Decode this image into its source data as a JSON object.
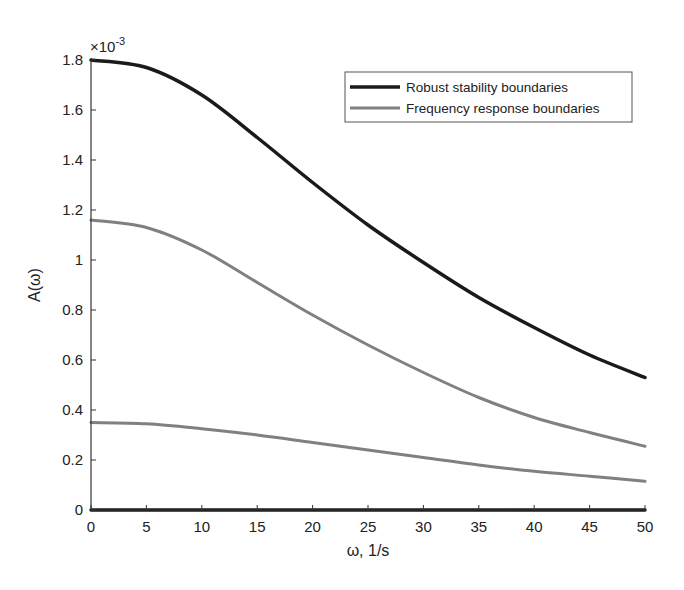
{
  "chart_data": {
    "type": "line",
    "title": "",
    "xlabel": "ω, 1/s",
    "ylabel": "A(ω)",
    "y_exponent_label": "×10",
    "y_exponent_power": "-3",
    "xlim": [
      0,
      50
    ],
    "ylim": [
      0,
      1.8
    ],
    "x_ticks": [
      0,
      5,
      10,
      15,
      20,
      25,
      30,
      35,
      40,
      45,
      50
    ],
    "y_ticks": [
      0,
      0.2,
      0.4,
      0.6,
      0.8,
      1,
      1.2,
      1.4,
      1.6,
      1.8
    ],
    "y_tick_labels": [
      "0",
      "0.2",
      "0.4",
      "0.6",
      "0.8",
      "1",
      "1.2",
      "1.4",
      "1.6",
      "1.8"
    ],
    "grid": false,
    "legend_position": "upper right",
    "x": [
      0,
      5,
      10,
      15,
      20,
      25,
      30,
      35,
      40,
      45,
      50
    ],
    "series": [
      {
        "name": "Robust stability boundaries",
        "color": "#1a1a1a",
        "width": 3.5,
        "legend": true,
        "values": [
          1.8,
          1.77,
          1.66,
          1.49,
          1.31,
          1.14,
          0.99,
          0.85,
          0.73,
          0.62,
          0.53
        ]
      },
      {
        "name": "Robust stability boundaries (lower)",
        "color": "#1a1a1a",
        "width": 3.5,
        "legend": false,
        "values": [
          0,
          0,
          0,
          0,
          0,
          0,
          0,
          0,
          0,
          0,
          0
        ]
      },
      {
        "name": "Frequency response boundaries",
        "color": "#808080",
        "width": 3,
        "legend": true,
        "values": [
          1.16,
          1.13,
          1.04,
          0.91,
          0.78,
          0.66,
          0.55,
          0.45,
          0.37,
          0.31,
          0.255
        ]
      },
      {
        "name": "Frequency response boundaries (lower)",
        "color": "#808080",
        "width": 3,
        "legend": false,
        "values": [
          0.35,
          0.345,
          0.325,
          0.3,
          0.27,
          0.24,
          0.21,
          0.18,
          0.155,
          0.135,
          0.115
        ]
      }
    ]
  }
}
